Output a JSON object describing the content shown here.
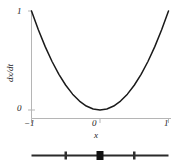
{
  "chart_data": {
    "type": "line",
    "title": "",
    "xlabel": "x",
    "ylabel": "dx/dt",
    "xlim": [
      -1,
      1
    ],
    "ylim": [
      0,
      1
    ],
    "grid": false,
    "legend": null,
    "x": [
      -1,
      -0.9,
      -0.8,
      -0.7,
      -0.6,
      -0.5,
      -0.4,
      -0.3,
      -0.2,
      -0.1,
      0,
      0.1,
      0.2,
      0.3,
      0.4,
      0.5,
      0.6,
      0.7,
      0.8,
      0.9,
      1
    ],
    "values": [
      1,
      0.81,
      0.64,
      0.49,
      0.36,
      0.25,
      0.16,
      0.09,
      0.04,
      0.01,
      0,
      0.01,
      0.04,
      0.09,
      0.16,
      0.25,
      0.36,
      0.49,
      0.64,
      0.81,
      1
    ],
    "series": [
      {
        "name": "dx/dt = x^2",
        "values": [
          1,
          0.81,
          0.64,
          0.49,
          0.36,
          0.25,
          0.16,
          0.09,
          0.04,
          0.01,
          0,
          0.01,
          0.04,
          0.09,
          0.16,
          0.25,
          0.36,
          0.49,
          0.64,
          0.81,
          1
        ]
      }
    ],
    "xticks": [
      -1,
      0,
      1
    ],
    "xticklabels": [
      "−1",
      "0",
      "1"
    ],
    "yticks": [
      0,
      1
    ],
    "yticklabels": [
      "0",
      "1"
    ],
    "phase_line": {
      "x_start": -1,
      "x_end": 1,
      "markers": [
        {
          "x": -0.5,
          "style": "tick",
          "filled": false
        },
        {
          "x": 0,
          "style": "dot",
          "filled": true
        },
        {
          "x": 0.5,
          "style": "tick",
          "filled": false
        }
      ]
    },
    "colors": {
      "curve": "#1a1a1a",
      "axis": "#b0b0b0",
      "text": "#1a1a1a",
      "phase_line": "#2a2a2a",
      "background": "#ffffff"
    }
  },
  "labels": {
    "y_title": "dx/dt",
    "x_title": "x",
    "y_tick_top": "1",
    "y_tick_bottom": "0",
    "x_tick_left": "−1",
    "x_tick_mid": "0",
    "x_tick_right": "1"
  }
}
